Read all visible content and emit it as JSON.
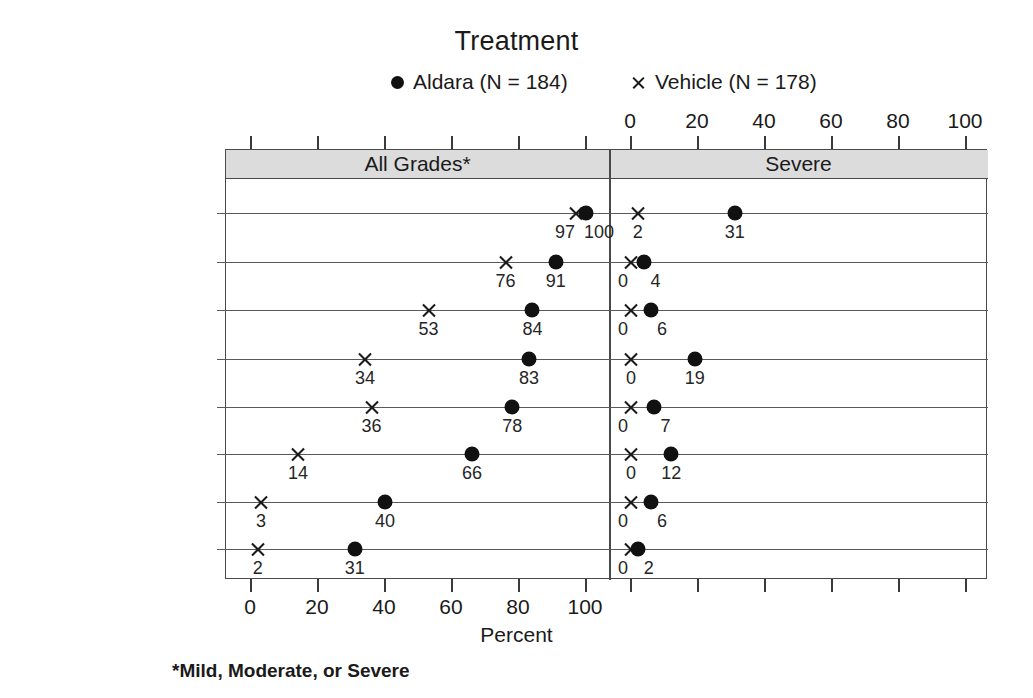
{
  "chart_data": {
    "type": "scatter",
    "title": "Treatment",
    "xlabel": "Percent",
    "ylabel": "",
    "footnote": "*Mild, Moderate, or Severe",
    "grid": false,
    "legend_position": "top",
    "xlim": [
      0,
      100
    ],
    "xticks": [
      0,
      20,
      40,
      60,
      80,
      100
    ],
    "xtick_labels": [
      "0",
      "20",
      "40",
      "60",
      "80",
      "100"
    ],
    "panels": [
      {
        "key": "all_grades",
        "label": "All Grades*"
      },
      {
        "key": "severe",
        "label": "Severe"
      }
    ],
    "legend": [
      {
        "name": "Aldara (N = 184)",
        "series": "aldara",
        "marker": "filled-circle",
        "color": "#111111"
      },
      {
        "name": "Vehicle (N = 178)",
        "series": "vehicle",
        "marker": "cross-x",
        "color": "#1a1a1a"
      }
    ],
    "categories": [
      "Erythema",
      "Flaking/Scaling",
      "Induration",
      "Scabbing/Crusting",
      "Edema",
      "Erosion",
      "Ulceration",
      "Vesicles"
    ],
    "series": [
      {
        "name": "Aldara (N = 184)",
        "key": "aldara",
        "panel_values": {
          "all_grades": [
            100,
            91,
            84,
            83,
            78,
            66,
            40,
            31
          ],
          "severe": [
            31,
            4,
            6,
            19,
            7,
            12,
            6,
            2
          ]
        }
      },
      {
        "name": "Vehicle (N = 178)",
        "key": "vehicle",
        "panel_values": {
          "all_grades": [
            97,
            76,
            53,
            34,
            36,
            14,
            3,
            2
          ],
          "severe": [
            2,
            0,
            0,
            0,
            0,
            0,
            0,
            0
          ]
        }
      }
    ]
  },
  "labels": {
    "title": "Treatment",
    "legend_aldara": "Aldara (N = 184)",
    "legend_vehicle": "Vehicle (N = 178)",
    "band_all_grades": "All Grades*",
    "band_severe": "Severe",
    "x_axis_title": "Percent",
    "footnote": "*Mild, Moderate, or Severe"
  },
  "axis": {
    "ticks": [
      "0",
      "20",
      "40",
      "60",
      "80",
      "100"
    ]
  },
  "rows": [
    {
      "label": "Erythema",
      "all_grades": {
        "aldara": "100",
        "vehicle": "97"
      },
      "severe": {
        "aldara": "31",
        "vehicle": "2"
      }
    },
    {
      "label": "Flaking/Scaling",
      "all_grades": {
        "aldara": "91",
        "vehicle": "76"
      },
      "severe": {
        "aldara": "4",
        "vehicle": "0"
      }
    },
    {
      "label": "Induration",
      "all_grades": {
        "aldara": "84",
        "vehicle": "53"
      },
      "severe": {
        "aldara": "6",
        "vehicle": "0"
      }
    },
    {
      "label": "Scabbing/Crusting",
      "all_grades": {
        "aldara": "83",
        "vehicle": "34"
      },
      "severe": {
        "aldara": "19",
        "vehicle": "0"
      }
    },
    {
      "label": "Edema",
      "all_grades": {
        "aldara": "78",
        "vehicle": "36"
      },
      "severe": {
        "aldara": "7",
        "vehicle": "0"
      }
    },
    {
      "label": "Erosion",
      "all_grades": {
        "aldara": "66",
        "vehicle": "14"
      },
      "severe": {
        "aldara": "12",
        "vehicle": "0"
      }
    },
    {
      "label": "Ulceration",
      "all_grades": {
        "aldara": "40",
        "vehicle": "3"
      },
      "severe": {
        "aldara": "6",
        "vehicle": "0"
      }
    },
    {
      "label": "Vesicles",
      "all_grades": {
        "aldara": "31",
        "vehicle": "2"
      },
      "severe": {
        "aldara": "2",
        "vehicle": "0"
      }
    }
  ]
}
